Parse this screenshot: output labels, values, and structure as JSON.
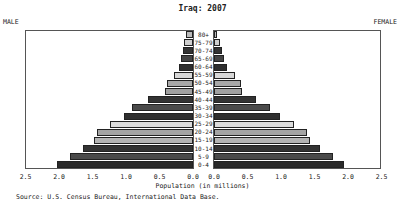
{
  "chart_data": {
    "type": "bar",
    "subtype": "population-pyramid",
    "title": "Iraq: 2007",
    "left_label": "MALE",
    "right_label": "FEMALE",
    "xlabel": "Population (in millions)",
    "source": "Source: U.S. Census Bureau, International Data Base.",
    "xlim": [
      0,
      2.5
    ],
    "ticks": [
      "2.5",
      "2.0",
      "1.5",
      "1.0",
      "0.5",
      "0.0",
      "0.0",
      "0.5",
      "1.0",
      "1.5",
      "2.0",
      "2.5"
    ],
    "categories": [
      "80+",
      "75-79",
      "70-74",
      "65-69",
      "60-64",
      "55-59",
      "50-54",
      "45-49",
      "40-44",
      "35-39",
      "30-34",
      "25-29",
      "20-24",
      "15-19",
      "10-14",
      "5-9",
      "0-4"
    ],
    "series": [
      {
        "name": "Male",
        "values": [
          0.1,
          0.13,
          0.15,
          0.18,
          0.21,
          0.28,
          0.39,
          0.42,
          0.67,
          0.91,
          1.03,
          1.24,
          1.43,
          1.48,
          1.64,
          1.84,
          2.03
        ]
      },
      {
        "name": "Female",
        "values": [
          0.05,
          0.09,
          0.12,
          0.15,
          0.19,
          0.31,
          0.4,
          0.42,
          0.63,
          0.84,
          0.99,
          1.19,
          1.39,
          1.43,
          1.58,
          1.78,
          1.94
        ]
      }
    ],
    "bar_colors": [
      "#bbbbbb",
      "#cfcfcf",
      "#333333",
      "#444444",
      "#2e2e2e",
      "#d8d8d8",
      "#a8a8a8",
      "#a0a0a0",
      "#333333",
      "#4a4a4a",
      "#2f2f2f",
      "#dcdcdc",
      "#a4a4a4",
      "#b4b4b4",
      "#333333",
      "#4a4a4a",
      "#2a2a2a"
    ],
    "grid": false,
    "legend": "none"
  }
}
